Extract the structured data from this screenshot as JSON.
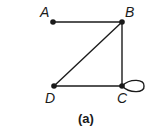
{
  "diagram": {
    "caption": "(a)",
    "nodes": [
      {
        "id": "A",
        "label": "A",
        "x": 53,
        "y": 22
      },
      {
        "id": "B",
        "label": "B",
        "x": 122,
        "y": 22
      },
      {
        "id": "C",
        "label": "C",
        "x": 122,
        "y": 86
      },
      {
        "id": "D",
        "label": "D",
        "x": 54,
        "y": 86
      }
    ],
    "edges": [
      {
        "from": "A",
        "to": "B"
      },
      {
        "from": "B",
        "to": "D"
      },
      {
        "from": "B",
        "to": "C"
      },
      {
        "from": "D",
        "to": "C"
      },
      {
        "from": "C",
        "to": "C",
        "type": "loop"
      }
    ],
    "colors": {
      "stroke": "#1a1a1a",
      "node": "#1a1a1a"
    }
  }
}
